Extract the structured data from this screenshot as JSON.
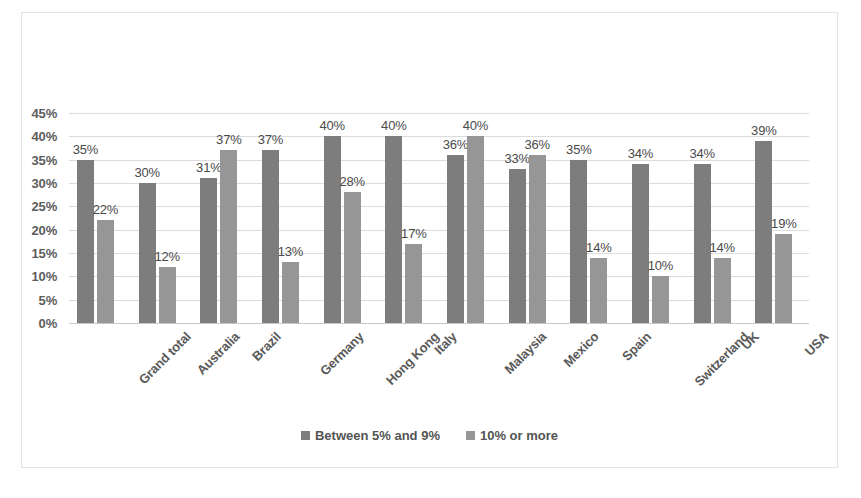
{
  "chart_data": {
    "type": "bar",
    "title": "",
    "subtitle": "",
    "xlabel": "",
    "ylabel": "",
    "ylim": [
      0,
      45
    ],
    "ytick_labels": [
      "0%",
      "5%",
      "10%",
      "15%",
      "20%",
      "25%",
      "30%",
      "35%",
      "40%",
      "45%"
    ],
    "ytick_values": [
      0,
      5,
      10,
      15,
      20,
      25,
      30,
      35,
      40,
      45
    ],
    "grid": true,
    "legend_position": "bottom",
    "data_labels": true,
    "categories": [
      "Grand total",
      "Australia",
      "Brazil",
      "Germany",
      "Hong Kong",
      "Italy",
      "Malaysia",
      "Mexico",
      "Spain",
      "Switzerland",
      "UK",
      "USA"
    ],
    "series": [
      {
        "name": "Between 5% and 9%",
        "color": "#7d7d7d",
        "values": [
          35,
          30,
          31,
          37,
          40,
          40,
          36,
          33,
          35,
          34,
          34,
          39
        ],
        "value_labels": [
          "35%",
          "30%",
          "31%",
          "37%",
          "40%",
          "40%",
          "36%",
          "33%",
          "35%",
          "34%",
          "34%",
          "39%"
        ]
      },
      {
        "name": "10% or more",
        "color": "#969696",
        "values": [
          22,
          12,
          37,
          13,
          28,
          17,
          40,
          36,
          14,
          10,
          14,
          19
        ],
        "value_labels": [
          "22%",
          "12%",
          "37%",
          "13%",
          "28%",
          "17%",
          "40%",
          "36%",
          "14%",
          "10%",
          "14%",
          "19%"
        ]
      }
    ]
  }
}
